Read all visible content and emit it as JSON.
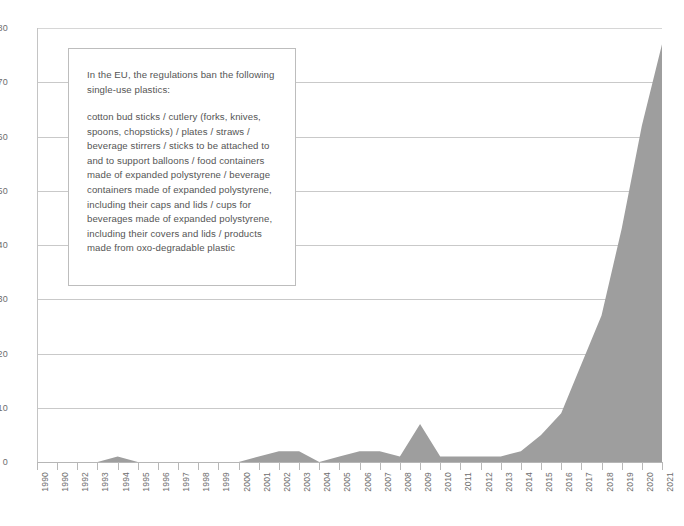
{
  "chart_data": {
    "type": "area",
    "title": "",
    "subtitle": "",
    "xlabel": "",
    "ylabel": "",
    "xlim": [
      1990,
      2021
    ],
    "ylim": [
      0,
      80
    ],
    "grid": true,
    "legend": "none",
    "series_color": "#9e9e9e",
    "categories": [
      "1990",
      "1991",
      "1992",
      "1993",
      "1994",
      "1995",
      "1996",
      "1997",
      "1998",
      "1999",
      "2000",
      "2001",
      "2002",
      "2003",
      "2004",
      "2005",
      "2006",
      "2007",
      "2008",
      "2009",
      "2010",
      "2011",
      "2012",
      "2013",
      "2014",
      "2015",
      "2016",
      "2017",
      "2018",
      "2019",
      "2020",
      "2021"
    ],
    "x_tick_labels": [
      "1990",
      "1990",
      "1992",
      "1993",
      "1994",
      "1995",
      "1996",
      "1997",
      "1998",
      "1999",
      "2000",
      "2001",
      "2002",
      "2003",
      "2004",
      "2005",
      "2006",
      "2007",
      "2008",
      "2009",
      "2010",
      "2011",
      "2012",
      "2013",
      "2014",
      "2015",
      "2016",
      "2017",
      "2018",
      "2019",
      "2020",
      "2021"
    ],
    "y_tick_labels": [
      "0",
      "10",
      "20",
      "30",
      "40",
      "50",
      "60",
      "70",
      "80"
    ],
    "y_ticks": [
      0,
      10,
      20,
      30,
      40,
      50,
      60,
      70,
      80
    ],
    "series": [
      {
        "name": "Single-use plastics regulation mentions",
        "values": [
          0,
          0,
          0,
          0,
          1,
          0,
          0,
          0,
          0,
          0,
          0,
          1,
          2,
          2,
          0,
          1,
          2,
          2,
          1,
          7,
          1,
          1,
          1,
          1,
          2,
          5,
          9,
          18,
          27,
          43,
          62,
          77
        ]
      }
    ]
  },
  "annotation": {
    "lead": "In the EU, the regulations ban the following single-use plastics:",
    "body": "cotton bud sticks / cutlery (forks, knives, spoons, chopsticks) / plates / straws / beverage stirrers / sticks to be attached to and to support balloons / food containers made of expanded polystyrene / beverage containers made of expanded polystyrene, including their caps and lids / cups for beverages made of expanded polystyrene, including their covers and lids / products made from oxo-degradable plastic"
  }
}
